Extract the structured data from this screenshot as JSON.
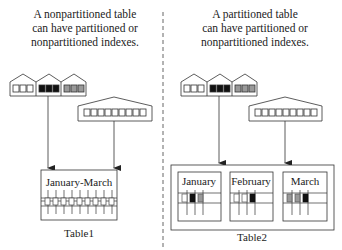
{
  "left_panel": {
    "caption_lines": [
      "A nonpartitioned table",
      "can have partitioned or",
      "nonpartitioned indexes."
    ],
    "table_label": "Table1",
    "table_partition_label": "January-March",
    "partitioned_index": {
      "segments": [
        "white",
        "black",
        "gray"
      ]
    },
    "nonpartitioned_index": {
      "key_count": 9
    },
    "row_count": 9
  },
  "right_panel": {
    "caption_lines": [
      "A partitioned table",
      "can have partitioned or",
      "nonpartitioned indexes."
    ],
    "table_label": "Table2",
    "partitions": [
      {
        "label": "January",
        "cells": [
          "white",
          "black",
          "gray"
        ]
      },
      {
        "label": "February",
        "cells": [
          "white",
          "white",
          "black"
        ]
      },
      {
        "label": "March",
        "cells": [
          "gray",
          "gray",
          "black"
        ]
      }
    ],
    "partitioned_index": {
      "segments": [
        "white",
        "black",
        "gray"
      ]
    },
    "nonpartitioned_index": {
      "key_count": 9
    }
  },
  "colors": {
    "line": "#333333",
    "gray": "#999999",
    "black": "#111111",
    "divider": "#666666"
  }
}
